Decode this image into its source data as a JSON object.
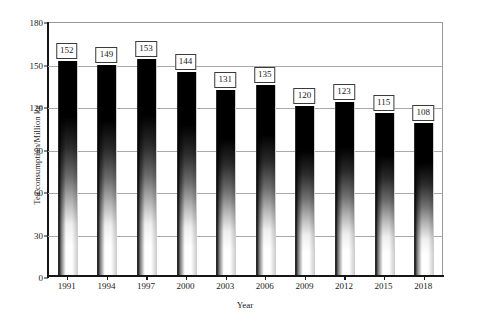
{
  "chart_data": {
    "type": "bar",
    "title": "",
    "subtitle": "",
    "xlabel": "Year",
    "ylabel": "Tea consumption/Million kg",
    "categories": [
      "1991",
      "1994",
      "1997",
      "2000",
      "2003",
      "2006",
      "2009",
      "2012",
      "2015",
      "2018"
    ],
    "values": [
      152,
      149,
      153,
      144,
      131,
      135,
      120,
      123,
      115,
      108
    ],
    "data_labels": [
      "152",
      "149",
      "153",
      "144",
      "131",
      "135",
      "120",
      "123",
      "115",
      "108"
    ],
    "ylim": [
      0,
      180
    ],
    "yticks": [
      0,
      30,
      60,
      90,
      120,
      150,
      180
    ],
    "ytick_labels": [
      "0",
      "30",
      "60",
      "90",
      "120",
      "150",
      "180"
    ],
    "grid": "horizontal",
    "legend": "none",
    "legend_position": "none",
    "series": [
      {
        "name": "Tea consumption",
        "values": [
          152,
          149,
          153,
          144,
          131,
          135,
          120,
          123,
          115,
          108
        ]
      }
    ],
    "bar_style": {
      "fill": "gradient-black-to-white",
      "top_color": "#000000",
      "bottom_color": "#ffffff",
      "edge_color": "#2a2a2a"
    },
    "axis_color": "#161616",
    "grid_color": "#a9a9a9",
    "label_box_border": "#3a3a3a",
    "background": "#ffffff"
  }
}
